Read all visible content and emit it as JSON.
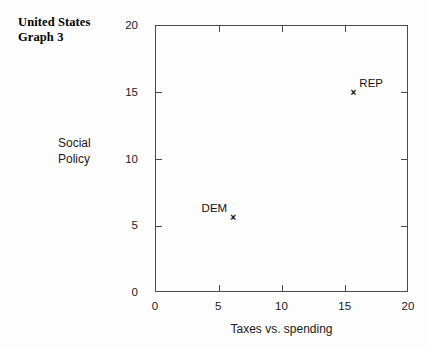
{
  "title": "United States\nGraph 3",
  "chart_data": {
    "type": "scatter",
    "title": "United States Graph 3",
    "xlabel": "Taxes vs. spending",
    "ylabel": "Social\nPolicy",
    "ylabel_flat": "Social Policy",
    "xlim": [
      0,
      20
    ],
    "ylim": [
      0,
      20
    ],
    "xticks": [
      0,
      5,
      10,
      15,
      20
    ],
    "yticks": [
      0,
      5,
      10,
      15,
      20
    ],
    "xtick_labels": [
      "0",
      "5",
      "10",
      "15",
      "20"
    ],
    "ytick_labels": [
      "0",
      "5",
      "10",
      "15",
      "20"
    ],
    "grid": false,
    "legend": "none",
    "tick_direction": "in",
    "frame": "four-sided",
    "marker": "x",
    "points": [
      {
        "label": "DEM",
        "x": 6.1,
        "y": 5.6,
        "label_position": "left"
      },
      {
        "label": "REP",
        "x": 15.6,
        "y": 15.0,
        "label_position": "right"
      }
    ]
  },
  "axis": {
    "marker_glyph": "×"
  }
}
